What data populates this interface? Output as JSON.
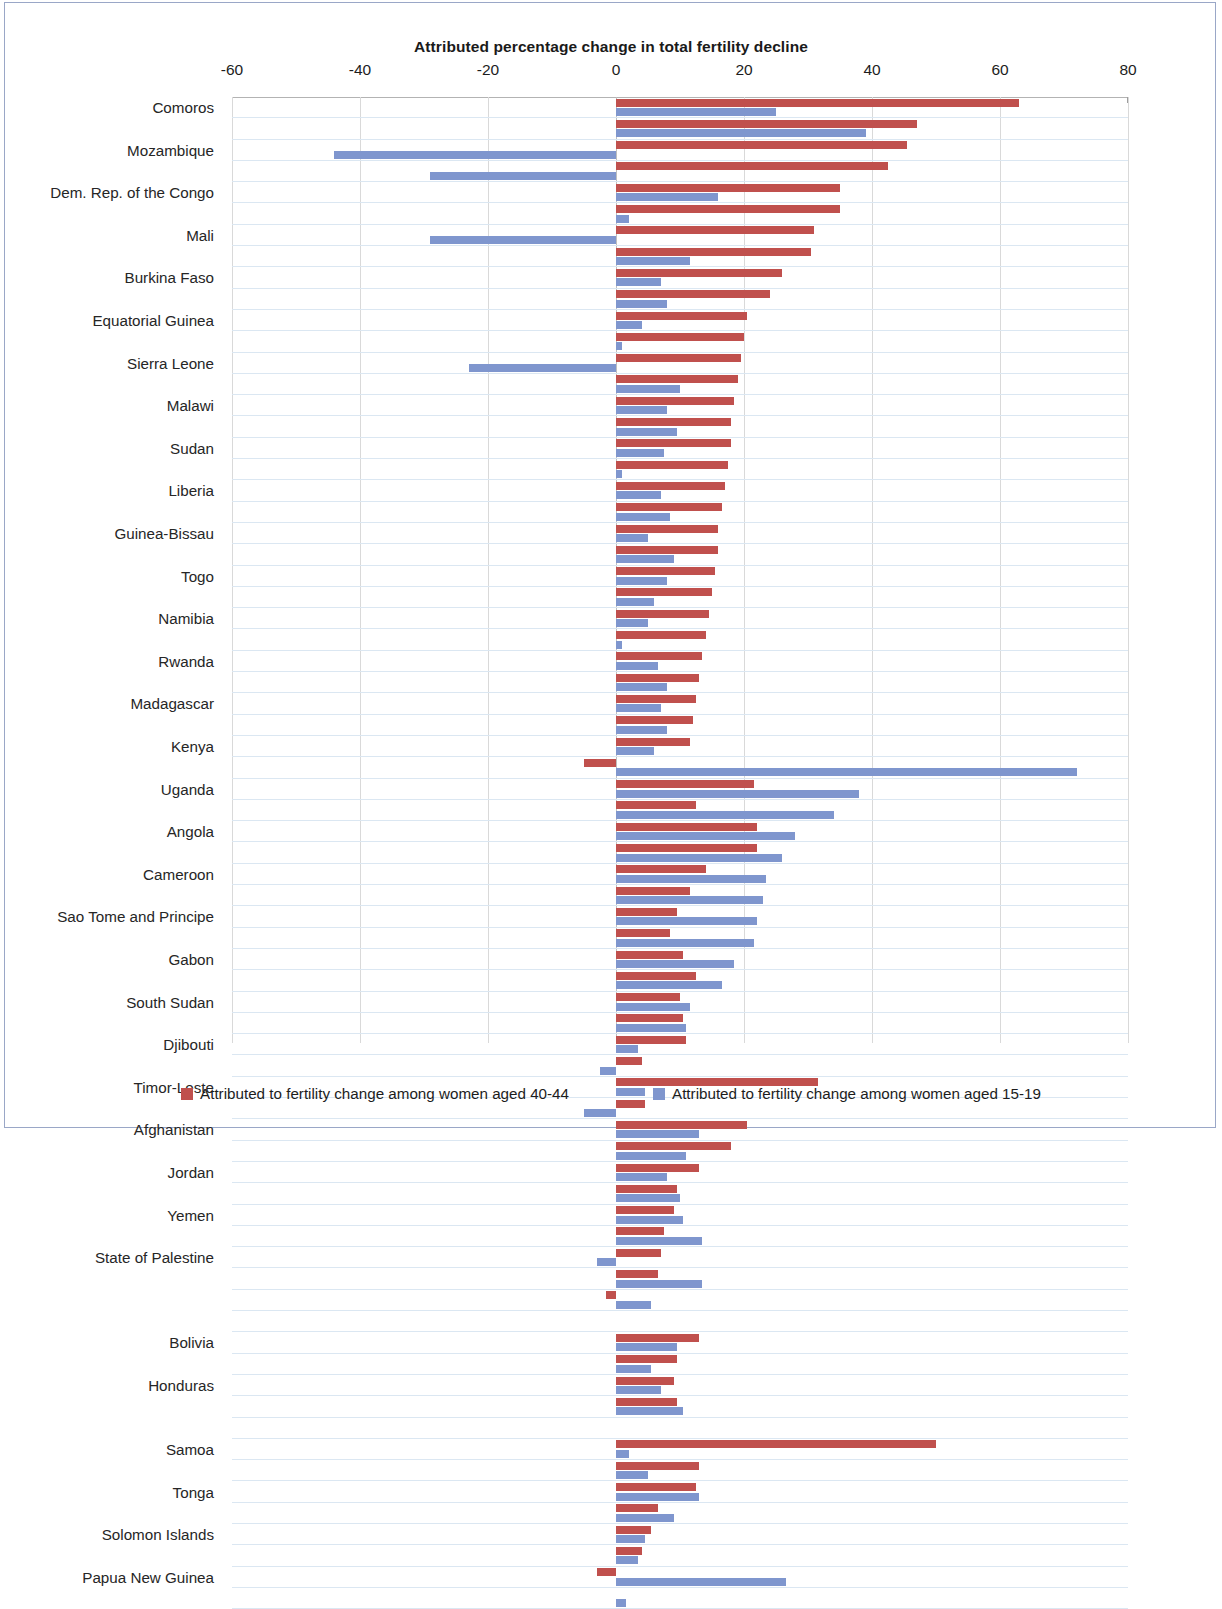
{
  "chart_data": {
    "type": "bar",
    "orientation": "horizontal",
    "title": "Attributed percentage change in total fertility decline",
    "xlabel": "",
    "ylabel": "",
    "xlim": [
      -60,
      80
    ],
    "xticks": [
      -60,
      -40,
      -20,
      0,
      20,
      40,
      60,
      80
    ],
    "xtick_labels": [
      "-60",
      "-40",
      "-20",
      "0",
      "20",
      "40",
      "60",
      "80"
    ],
    "grid": true,
    "legend_position": "bottom",
    "colors": {
      "series_40_44": "#c0504d",
      "series_15_19": "#7f96ce"
    },
    "series": [
      {
        "name": "Attributed to fertility change among women aged 40-44",
        "color": "#c0504d",
        "values": [
          63,
          47,
          45.5,
          42.5,
          35,
          35,
          31,
          30.5,
          26,
          24,
          20.5,
          20,
          19.5,
          19,
          18.5,
          18,
          18,
          17.5,
          17,
          16.5,
          16,
          16,
          15.5,
          15,
          14.5,
          14,
          13.5,
          13,
          12.5,
          12,
          11.5,
          -5,
          21.5,
          12.5,
          22,
          22,
          14,
          11.5,
          9.5,
          8.5,
          10.5,
          12.5,
          10,
          10.5,
          11,
          4,
          31.5,
          4.5,
          20.5,
          18,
          13,
          9.5,
          9,
          7.5,
          7,
          6.5,
          3,
          -1.5,
          13,
          9.5,
          9,
          9.5,
          50,
          13,
          12.5,
          6.5,
          5.5,
          4,
          3,
          -3,
          0
        ]
      },
      {
        "name": "Attributed to fertility change among women aged 15-19",
        "color": "#7f96ce",
        "values": [
          25,
          0,
          39,
          0,
          -44,
          0,
          -29,
          0,
          16,
          0,
          2,
          0,
          -29,
          0,
          11.5,
          0,
          7,
          0,
          8,
          0,
          4,
          0,
          1,
          0,
          -23,
          0,
          10,
          0,
          8,
          0,
          9.5,
          0,
          7.5,
          0,
          1,
          0,
          7,
          0,
          8.5,
          0,
          72,
          0,
          38,
          0,
          34,
          0,
          28,
          0,
          26,
          0,
          23.5,
          0,
          23,
          0,
          22,
          0,
          21.5,
          0,
          18.5,
          0,
          16.5,
          0,
          11.5,
          0,
          3.5,
          0,
          -2.5,
          0,
          13,
          0,
          11,
          0,
          13.5,
          0,
          5.5,
          0,
          9.5,
          0,
          10.5,
          0,
          2,
          0,
          9,
          0,
          4.5,
          0,
          26.5,
          0,
          1.5
        ]
      }
    ],
    "rows": [
      {
        "label": "Comoros",
        "red": 63,
        "blue": 25
      },
      {
        "label": "",
        "red": 47,
        "blue": 39
      },
      {
        "label": "Mozambique",
        "red": 45.5,
        "blue": -44
      },
      {
        "label": "",
        "red": 42.5,
        "blue": -29
      },
      {
        "label": "Dem. Rep. of the Congo",
        "red": 35,
        "blue": 16
      },
      {
        "label": "",
        "red": 35,
        "blue": 2
      },
      {
        "label": "Mali",
        "red": 31,
        "blue": -29
      },
      {
        "label": "",
        "red": 30.5,
        "blue": 11.5
      },
      {
        "label": "Burkina Faso",
        "red": 26,
        "blue": 7
      },
      {
        "label": "",
        "red": 24,
        "blue": 8
      },
      {
        "label": "Equatorial Guinea",
        "red": 20.5,
        "blue": 4
      },
      {
        "label": "",
        "red": 20,
        "blue": 1
      },
      {
        "label": "Sierra Leone",
        "red": 19.5,
        "blue": -23
      },
      {
        "label": "",
        "red": 19,
        "blue": 10
      },
      {
        "label": "Malawi",
        "red": 18.5,
        "blue": 8
      },
      {
        "label": "",
        "red": 18,
        "blue": 9.5
      },
      {
        "label": "Sudan",
        "red": 18,
        "blue": 7.5
      },
      {
        "label": "",
        "red": 17.5,
        "blue": 1
      },
      {
        "label": "Liberia",
        "red": 17,
        "blue": 7
      },
      {
        "label": "",
        "red": 16.5,
        "blue": 8.5
      },
      {
        "label": "Guinea-Bissau",
        "red": 16,
        "blue": 5
      },
      {
        "label": "",
        "red": 16,
        "blue": 9
      },
      {
        "label": "Togo",
        "red": 15.5,
        "blue": 8
      },
      {
        "label": "",
        "red": 15,
        "blue": 6
      },
      {
        "label": "Namibia",
        "red": 14.5,
        "blue": 5
      },
      {
        "label": "",
        "red": 14,
        "blue": 1
      },
      {
        "label": "Rwanda",
        "red": 13.5,
        "blue": 6.5
      },
      {
        "label": "",
        "red": 13,
        "blue": 8
      },
      {
        "label": "Madagascar",
        "red": 12.5,
        "blue": 7
      },
      {
        "label": "",
        "red": 12,
        "blue": 8
      },
      {
        "label": "Kenya",
        "red": 11.5,
        "blue": 6
      },
      {
        "label": "",
        "red": -5,
        "blue": 72
      },
      {
        "label": "Uganda",
        "red": 21.5,
        "blue": 38
      },
      {
        "label": "",
        "red": 12.5,
        "blue": 34
      },
      {
        "label": "Angola",
        "red": 22,
        "blue": 28
      },
      {
        "label": "",
        "red": 22,
        "blue": 26
      },
      {
        "label": "Cameroon",
        "red": 14,
        "blue": 23.5
      },
      {
        "label": "",
        "red": 11.5,
        "blue": 23
      },
      {
        "label": "Sao Tome and Principe",
        "red": 9.5,
        "blue": 22
      },
      {
        "label": "",
        "red": 8.5,
        "blue": 21.5
      },
      {
        "label": "Gabon",
        "red": 10.5,
        "blue": 18.5
      },
      {
        "label": "",
        "red": 12.5,
        "blue": 16.5
      },
      {
        "label": "South Sudan",
        "red": 10,
        "blue": 11.5
      },
      {
        "label": "",
        "red": 10.5,
        "blue": 11
      },
      {
        "label": "Djibouti",
        "red": 11,
        "blue": 3.5
      },
      {
        "label": "",
        "red": 4,
        "blue": -2.5
      },
      {
        "label": "Timor-Leste",
        "red": 31.5,
        "blue": 4.5
      },
      {
        "label": "",
        "red": 4.5,
        "blue": -5
      },
      {
        "label": "Afghanistan",
        "red": 20.5,
        "blue": 13
      },
      {
        "label": "",
        "red": 18,
        "blue": 11
      },
      {
        "label": "Jordan",
        "red": 13,
        "blue": 8
      },
      {
        "label": "",
        "red": 9.5,
        "blue": 10
      },
      {
        "label": "Yemen",
        "red": 9,
        "blue": 10.5
      },
      {
        "label": "",
        "red": 7.5,
        "blue": 13.5
      },
      {
        "label": "State of Palestine",
        "red": 7,
        "blue": -3
      },
      {
        "label": "",
        "red": 6.5,
        "blue": 13.5
      },
      {
        "label": "",
        "red": -1.5,
        "blue": 5.5
      },
      {
        "label": "",
        "red": 0,
        "blue": 0
      },
      {
        "label": "Bolivia",
        "red": 13,
        "blue": 9.5
      },
      {
        "label": "",
        "red": 9.5,
        "blue": 5.5
      },
      {
        "label": "Honduras",
        "red": 9,
        "blue": 7
      },
      {
        "label": "",
        "red": 9.5,
        "blue": 10.5
      },
      {
        "label": "",
        "red": 0,
        "blue": 0
      },
      {
        "label": "Samoa",
        "red": 50,
        "blue": 2
      },
      {
        "label": "",
        "red": 13,
        "blue": 5
      },
      {
        "label": "Tonga",
        "red": 12.5,
        "blue": 13
      },
      {
        "label": "",
        "red": 6.5,
        "blue": 9
      },
      {
        "label": "Solomon Islands",
        "red": 5.5,
        "blue": 4.5
      },
      {
        "label": "",
        "red": 4,
        "blue": 3.5
      },
      {
        "label": "Papua New Guinea",
        "red": -3,
        "blue": 26.5
      },
      {
        "label": "",
        "red": 0,
        "blue": 1.5
      }
    ],
    "legend": [
      {
        "label": "Attributed to fertility change among women aged 40-44",
        "color": "#c0504d"
      },
      {
        "label": "Attributed to fertility change among women aged 15-19",
        "color": "#7f96ce"
      }
    ]
  }
}
